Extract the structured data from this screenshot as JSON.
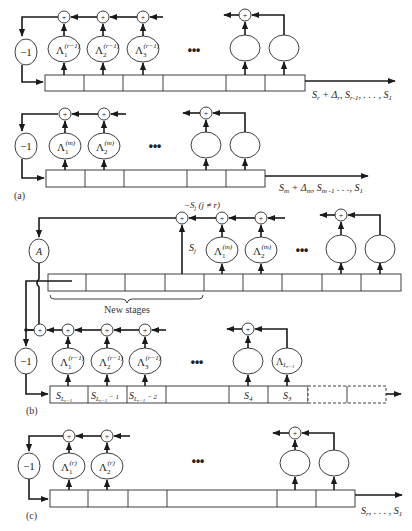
{
  "figure": {
    "panels": [
      {
        "id": "a",
        "label": "(a)",
        "subdiagrams": [
          {
            "gain_label": "−1",
            "taps": [
              "Λ1(r−1)",
              "Λ2(r−1)",
              "Λ3(r−1)",
              "",
              ""
            ],
            "tap_base": [
              "Λ",
              "Λ",
              "Λ"
            ],
            "tap_sub": [
              "1",
              "2",
              "3"
            ],
            "tap_sup": [
              "(r−1)",
              "(r−1)",
              "(r−1)"
            ],
            "ellipsis": "•••",
            "output_label": "S_r + Δ_r, S_r−1, . . . , S_1",
            "output_parts": [
              "S",
              "r",
              " + Δ",
              "r",
              ", S",
              "r-1",
              ", . . . , S",
              "1"
            ]
          },
          {
            "gain_label": "−1",
            "taps": [
              "Λ1(m)",
              "Λ2(m)",
              "",
              ""
            ],
            "tap_base": [
              "Λ",
              "Λ"
            ],
            "tap_sub": [
              "1",
              "2"
            ],
            "tap_sup": [
              "(m)",
              "(m)"
            ],
            "ellipsis": "•••",
            "output_label": "S_m + Δ_m, S_m−1 . . ., S_1",
            "output_parts": [
              "S",
              "m",
              " + Δ",
              "m",
              ", S",
              "m -1",
              " . . ., S",
              "1"
            ]
          }
        ]
      },
      {
        "id": "b",
        "label": "(b)",
        "top": {
          "gain_label": "A",
          "feedback_label": "−S_j (j ≠ r)",
          "feedback_parts": [
            "−S",
            "j",
            " (j ≠ r)"
          ],
          "tap_label": "S_j",
          "tap_parts": [
            "S",
            "j"
          ],
          "taps": [
            "Λ1(m)",
            "Λ2(m)",
            "",
            ""
          ],
          "tap_base": [
            "Λ",
            "Λ"
          ],
          "tap_sub": [
            "1",
            "2"
          ],
          "tap_sup": [
            "(m)",
            "(m)"
          ],
          "ellipsis": "•••",
          "brace_label": "New stages"
        },
        "bottom": {
          "gain_label": "−1",
          "taps": [
            "Λ1(r−1)",
            "Λ2(r−1)",
            "Λ3(r−1)",
            "",
            "Λ_L(r−1)"
          ],
          "tap_base": [
            "Λ",
            "Λ",
            "Λ"
          ],
          "tap_sub": [
            "1",
            "2",
            "3"
          ],
          "tap_sup": [
            "(r−1)",
            "(r−1)",
            "(r−1)"
          ],
          "last_tap": "Λ",
          "last_tap_sub": "L",
          "last_tap_subsub": "r−1",
          "ellipsis": "•••",
          "cells": [
            "S_L(r-1)",
            "S_L(r-1) − 1",
            "S_L(r-1) − 2",
            "",
            "S_4",
            "S_3",
            "",
            ""
          ],
          "cell_labels": {
            "c0": "S",
            "c0_sub": "L",
            "c0_subsub": "r−1",
            "c1_suffix": " − 1",
            "c2_suffix": " − 2",
            "c4": "S",
            "c4_sub": "4",
            "c5": "S",
            "c5_sub": "3"
          }
        }
      },
      {
        "id": "c",
        "label": "(c)",
        "gain_label": "−1",
        "taps": [
          "Λ1(r)",
          "Λ2(r)",
          "",
          ""
        ],
        "tap_base": [
          "Λ",
          "Λ"
        ],
        "tap_sub": [
          "1",
          "2"
        ],
        "tap_sup": [
          "(r)",
          "(r)"
        ],
        "ellipsis": "•••",
        "output_label": "S_r, . . . , S_1",
        "output_parts": [
          "S",
          "r",
          ", . . . , S",
          "1"
        ]
      }
    ],
    "symbols": {
      "sum": "+"
    }
  }
}
